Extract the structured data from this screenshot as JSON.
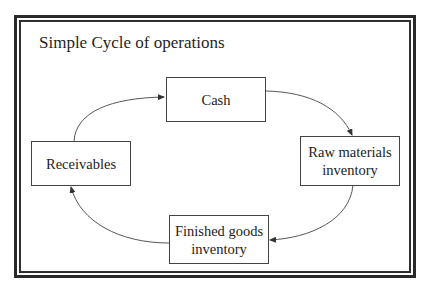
{
  "diagram": {
    "title": "Simple Cycle of operations",
    "nodes": [
      {
        "id": "cash",
        "label": "Cash"
      },
      {
        "id": "raw",
        "label": "Raw materials inventory",
        "lines": [
          "Raw materials",
          "inventory"
        ]
      },
      {
        "id": "finished",
        "label": "Finished goods inventory",
        "lines": [
          "Finished goods",
          "inventory"
        ]
      },
      {
        "id": "receivables",
        "label": "Receivables"
      }
    ],
    "edges": [
      {
        "from": "cash",
        "to": "raw"
      },
      {
        "from": "raw",
        "to": "finished"
      },
      {
        "from": "finished",
        "to": "receivables"
      },
      {
        "from": "receivables",
        "to": "cash"
      }
    ],
    "colors": {
      "line": "#333333",
      "text": "#1f1f1f",
      "background": "#ffffff"
    }
  }
}
